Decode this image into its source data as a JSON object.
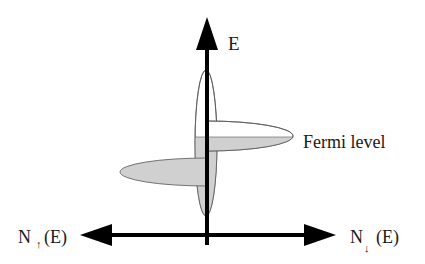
{
  "diagram": {
    "type": "spin-polarized density of states",
    "labels": {
      "energy_axis": "E",
      "fermi_level": "Fermi level",
      "left_axis_prefix": "N",
      "left_axis_spin": "↑",
      "left_axis_suffix": "(E)",
      "right_axis_prefix": "N",
      "right_axis_spin": "↓",
      "right_axis_suffix": "(E)"
    },
    "colors": {
      "axis": "#000000",
      "filled_states": "#d0d0d0",
      "empty_states": "#ffffff",
      "outline": "#555555",
      "text": "#1a1a1a"
    },
    "components": [
      {
        "name": "broad-band",
        "description": "narrow tall ellipse centered on energy axis, filled below Fermi level"
      },
      {
        "name": "spin-up-peak",
        "description": "left ellipse on N↑ side, fully filled (below Fermi level)"
      },
      {
        "name": "spin-down-peak",
        "description": "right ellipse on N↓ side, straddling Fermi level, filled below"
      }
    ]
  }
}
